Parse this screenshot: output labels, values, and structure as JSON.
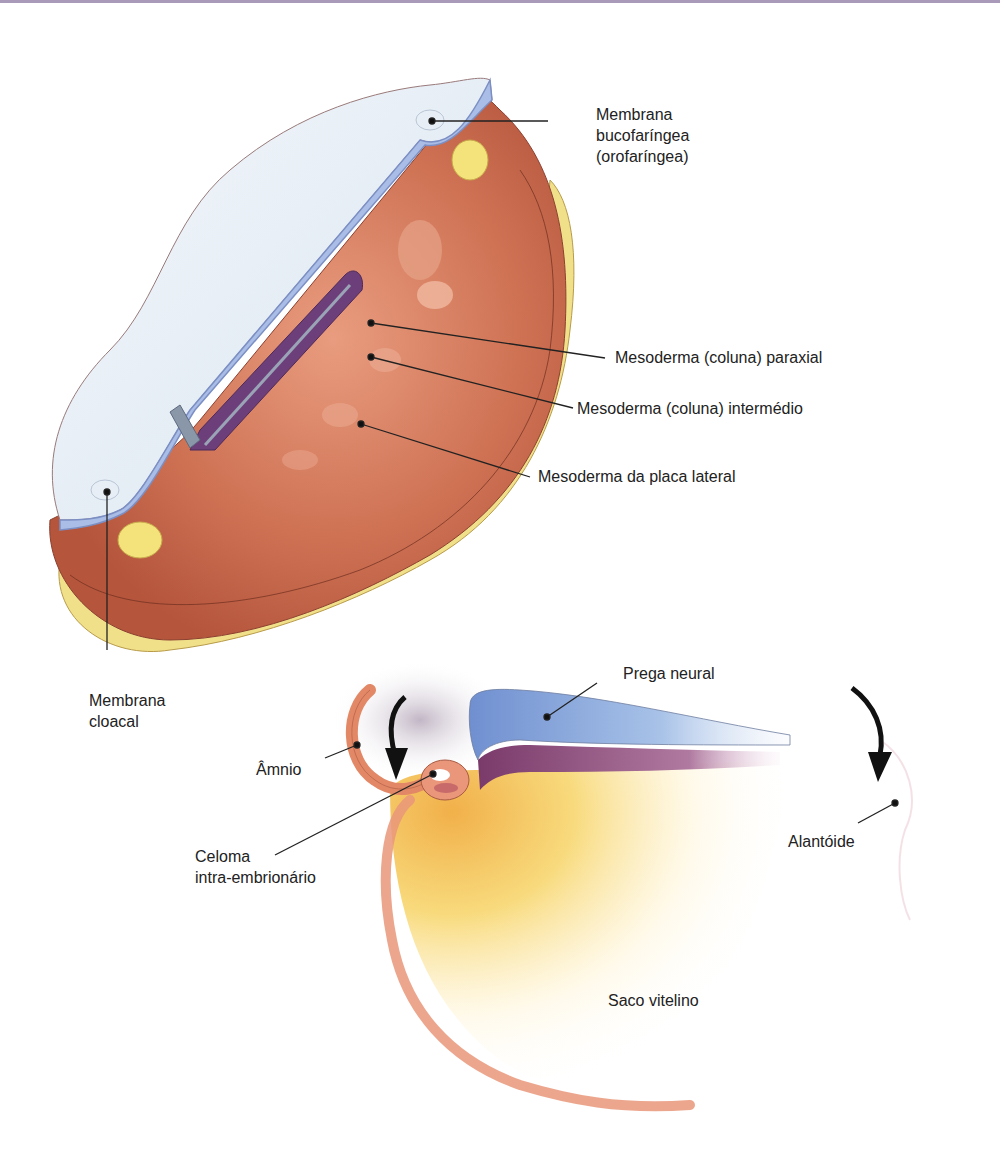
{
  "figure": {
    "top_rule_color": "#a89ab8",
    "panels": [
      {
        "name": "embrião trilaminar (vista dorsal, corte)",
        "labels": {
          "membrana_bucofaringea": [
            "Membrana",
            "bucofaríngea",
            "(orofaríngea)"
          ],
          "mesoderma_paraxial": "Mesoderma (coluna) paraxial",
          "mesoderma_intermedio": "Mesoderma (coluna) intermédio",
          "mesoderma_placa_lateral": "Mesoderma da placa lateral",
          "membrana_cloacal": [
            "Membrana",
            "cloacal"
          ]
        }
      },
      {
        "name": "corte sagital (dobramento)",
        "labels": {
          "prega_neural": "Prega neural",
          "amnio": "Âmnio",
          "celoma": [
            "Celoma",
            "intra-embrionário"
          ],
          "alantoide": "Alantóide",
          "saco_vitelino": "Saco vitelino"
        }
      }
    ],
    "colors": {
      "ectoderm": "#dfe9f3",
      "ectoderm_edge": "#9eb3dc",
      "mesoderm": "#c8674a",
      "mesoderm_light": "#e5957a",
      "endoderm": "#f1e08a",
      "neural": "#6c3f7a",
      "yolk": "#f5c24a"
    }
  }
}
